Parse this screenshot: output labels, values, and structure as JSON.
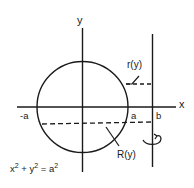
{
  "diagram": {
    "type": "solid-of-revolution",
    "axes": {
      "x_label": "x",
      "y_label": "y"
    },
    "points": {
      "neg_a": "-a",
      "a": "a",
      "b": "b"
    },
    "labels": {
      "inner_radius": "r(y)",
      "outer_radius": "R(y)",
      "equation_base": "x",
      "equation_exp1": "2",
      "equation_plus": " + y",
      "equation_exp2": "2",
      "equation_eq": " = a",
      "equation_exp3": "2"
    },
    "equation": "x^2 + y^2 = a^2",
    "colors": {
      "ink": "#1a1a1a",
      "background": "#ffffff"
    }
  }
}
